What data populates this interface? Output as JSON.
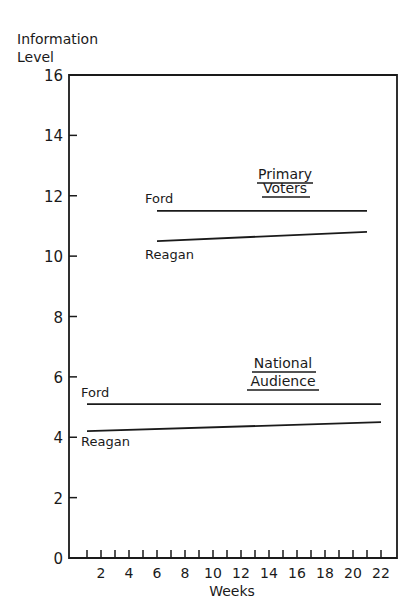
{
  "chart_data": {
    "type": "line",
    "title": "",
    "xlabel": "Weeks",
    "ylabel": "Information Level",
    "xlim": [
      0,
      23
    ],
    "ylim": [
      0,
      16
    ],
    "x_ticks": [
      2,
      4,
      6,
      8,
      10,
      12,
      14,
      16,
      18,
      20,
      22
    ],
    "y_ticks": [
      0,
      2,
      4,
      6,
      8,
      10,
      12,
      14,
      16
    ],
    "grid": false,
    "groups": [
      {
        "name": "Primary Voters",
        "series": [
          {
            "name": "Ford",
            "x": [
              6,
              21
            ],
            "values": [
              11.5,
              11.5
            ]
          },
          {
            "name": "Reagan",
            "x": [
              6,
              21
            ],
            "values": [
              10.5,
              10.8
            ]
          }
        ]
      },
      {
        "name": "National Audience",
        "series": [
          {
            "name": "Ford",
            "x": [
              1,
              22
            ],
            "values": [
              5.1,
              5.1
            ]
          },
          {
            "name": "Reagan",
            "x": [
              1,
              22
            ],
            "values": [
              4.2,
              4.5
            ]
          }
        ]
      }
    ]
  },
  "labels": {
    "ylabel_line1": "Information",
    "ylabel_line2": "Level",
    "xlabel": "Weeks",
    "primary_line1": "Primary",
    "primary_line2": "Voters",
    "national_line1": "National",
    "national_line2": "Audience",
    "ford": "Ford",
    "reagan": "Reagan"
  }
}
